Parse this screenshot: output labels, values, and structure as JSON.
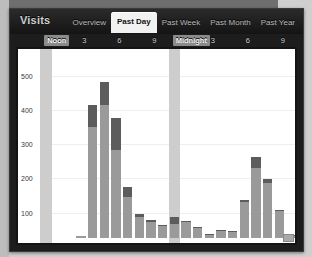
{
  "window": {
    "title": "Visits",
    "accent_selected_tab": "#f2f2f2",
    "chrome_color": "#1d1d1d"
  },
  "tabs": [
    {
      "label": "Overview",
      "selected": false
    },
    {
      "label": "Past Day",
      "selected": true
    },
    {
      "label": "Past Week",
      "selected": false
    },
    {
      "label": "Past Month",
      "selected": false
    },
    {
      "label": "Past Year",
      "selected": false
    }
  ],
  "chart_data": {
    "type": "bar",
    "title": "Visits",
    "xlabel": "",
    "ylabel": "",
    "stacked": true,
    "grid": true,
    "legend_position": "none",
    "ylim": [
      0,
      560
    ],
    "yticks": [
      0,
      100,
      200,
      300,
      400,
      500
    ],
    "ytick_labels": [
      "0",
      "100",
      "200",
      "300",
      "400",
      "500"
    ],
    "xtick_labels": [
      "Noon",
      "3",
      "6",
      "9",
      "Midnight",
      "3",
      "6",
      "9"
    ],
    "xtick_highlighted": [
      "Noon",
      "Midnight"
    ],
    "highlight_bands": [
      "Noon",
      "Midnight"
    ],
    "colors": {
      "series_lower": "#9a9a9a",
      "series_upper": "#5c5c5c",
      "highlight_band": "#cdcdcd",
      "gridline": "#eceff2",
      "plot_background": "#ffffff"
    },
    "series": [
      {
        "name": "lower",
        "values": [
          0,
          0,
          0,
          5,
          325,
          388,
          258,
          120,
          62,
          48,
          36,
          42,
          48,
          30,
          10,
          20,
          18,
          105,
          205,
          160,
          80,
          8
        ]
      },
      {
        "name": "upper",
        "values": [
          0,
          0,
          0,
          0,
          63,
          68,
          92,
          28,
          8,
          4,
          2,
          18,
          3,
          2,
          2,
          2,
          2,
          6,
          30,
          12,
          3,
          2
        ]
      }
    ],
    "totals": [
      0,
      0,
      0,
      5,
      388,
      456,
      350,
      148,
      70,
      52,
      38,
      60,
      51,
      32,
      12,
      22,
      20,
      111,
      235,
      172,
      83,
      10
    ],
    "bar_count": 22
  }
}
